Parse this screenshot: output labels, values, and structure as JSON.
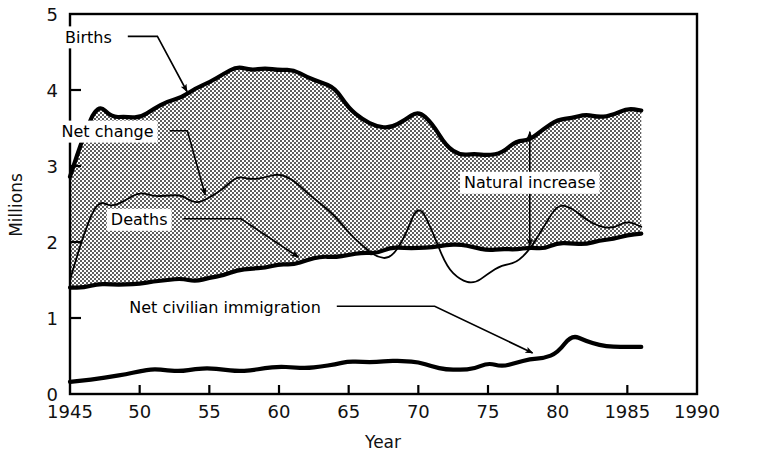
{
  "chart_data": {
    "type": "area",
    "title": "",
    "subtitle": "",
    "xlabel": "Year",
    "ylabel": "Millions",
    "xlim": [
      1945,
      1990
    ],
    "ylim": [
      0,
      5
    ],
    "grid": false,
    "legend_position": "inline-annotations",
    "x_ticks": [
      {
        "value": 1945,
        "label": "1945"
      },
      {
        "value": 1950,
        "label": "50"
      },
      {
        "value": 1955,
        "label": "55"
      },
      {
        "value": 1960,
        "label": "60"
      },
      {
        "value": 1965,
        "label": "65"
      },
      {
        "value": 1970,
        "label": "70"
      },
      {
        "value": 1975,
        "label": "75"
      },
      {
        "value": 1980,
        "label": "80"
      },
      {
        "value": 1985,
        "label": "1985"
      },
      {
        "value": 1990,
        "label": "1990"
      }
    ],
    "y_ticks": [
      {
        "value": 0,
        "label": "0"
      },
      {
        "value": 1,
        "label": "1"
      },
      {
        "value": 2,
        "label": "2"
      },
      {
        "value": 3,
        "label": "3"
      },
      {
        "value": 4,
        "label": "4"
      },
      {
        "value": 5,
        "label": "5"
      }
    ],
    "x": [
      1945,
      1946,
      1947,
      1948,
      1949,
      1950,
      1951,
      1952,
      1953,
      1954,
      1955,
      1956,
      1957,
      1958,
      1959,
      1960,
      1961,
      1962,
      1963,
      1964,
      1965,
      1966,
      1967,
      1968,
      1969,
      1970,
      1971,
      1972,
      1973,
      1974,
      1975,
      1976,
      1977,
      1978,
      1979,
      1980,
      1981,
      1982,
      1983,
      1984,
      1985,
      1986
    ],
    "series": [
      {
        "name": "Births",
        "style": "thick-line-upper-boundary-of-shaded-area",
        "values": [
          2.86,
          3.41,
          3.82,
          3.64,
          3.65,
          3.63,
          3.75,
          3.85,
          3.9,
          4.02,
          4.1,
          4.21,
          4.31,
          4.26,
          4.29,
          4.26,
          4.27,
          4.17,
          4.1,
          4.03,
          3.76,
          3.61,
          3.52,
          3.5,
          3.6,
          3.73,
          3.56,
          3.26,
          3.14,
          3.16,
          3.14,
          3.17,
          3.33,
          3.34,
          3.49,
          3.61,
          3.63,
          3.68,
          3.64,
          3.67,
          3.76,
          3.73
        ]
      },
      {
        "name": "Deaths",
        "style": "thick-line-lower-boundary-of-shaded-area",
        "values": [
          1.4,
          1.4,
          1.45,
          1.44,
          1.44,
          1.45,
          1.48,
          1.5,
          1.52,
          1.48,
          1.53,
          1.56,
          1.63,
          1.65,
          1.66,
          1.71,
          1.7,
          1.76,
          1.81,
          1.8,
          1.83,
          1.86,
          1.85,
          1.93,
          1.92,
          1.92,
          1.93,
          1.96,
          1.97,
          1.93,
          1.89,
          1.91,
          1.9,
          1.93,
          1.91,
          1.99,
          1.98,
          1.97,
          2.02,
          2.04,
          2.09,
          2.11
        ]
      },
      {
        "name": "Net change",
        "style": "thin-line-inside-shaded-area",
        "values": [
          1.5,
          2.12,
          2.55,
          2.46,
          2.55,
          2.66,
          2.6,
          2.61,
          2.62,
          2.5,
          2.58,
          2.7,
          2.87,
          2.82,
          2.85,
          2.9,
          2.82,
          2.65,
          2.5,
          2.35,
          2.12,
          1.95,
          1.8,
          1.78,
          2.05,
          2.52,
          2.15,
          1.68,
          1.5,
          1.45,
          1.58,
          1.7,
          1.72,
          1.9,
          2.2,
          2.5,
          2.45,
          2.3,
          2.2,
          2.18,
          2.28,
          2.2
        ]
      },
      {
        "name": "Net civilian immigration",
        "style": "thick-line-standalone",
        "values": [
          0.16,
          0.18,
          0.2,
          0.23,
          0.26,
          0.3,
          0.33,
          0.31,
          0.3,
          0.33,
          0.34,
          0.32,
          0.3,
          0.31,
          0.34,
          0.36,
          0.35,
          0.34,
          0.36,
          0.39,
          0.43,
          0.42,
          0.42,
          0.44,
          0.43,
          0.42,
          0.36,
          0.32,
          0.32,
          0.33,
          0.41,
          0.36,
          0.41,
          0.46,
          0.47,
          0.54,
          0.78,
          0.7,
          0.64,
          0.62,
          0.62,
          0.62
        ]
      }
    ],
    "annotations": [
      {
        "id": "births",
        "text": "Births",
        "label_x": 1948.0,
        "label_y": 4.62,
        "arrow_to_x": 1953.4,
        "arrow_to_y": 3.98,
        "arrow": "single"
      },
      {
        "id": "net-change",
        "text": "Net change",
        "label_x": 1951.0,
        "label_y": 3.38,
        "arrow_to_x": 1954.7,
        "arrow_to_y": 2.62,
        "arrow": "single"
      },
      {
        "id": "deaths",
        "text": "Deaths",
        "label_x": 1952.0,
        "label_y": 2.22,
        "arrow_to_x": 1961.4,
        "arrow_to_y": 1.8,
        "arrow": "single"
      },
      {
        "id": "natural-increase",
        "text": "Natural increase",
        "label_x": 1978.0,
        "label_y": 2.72,
        "arrow_to_x": 1978.0,
        "arrow_to_y": 3.45,
        "arrow_from_x": 1978.0,
        "arrow_from_y": 1.95,
        "arrow": "double-vertical"
      },
      {
        "id": "net-civilian-immigration",
        "text": "Net civilian immigration",
        "label_x": 1963.0,
        "label_y": 1.07,
        "arrow_to_x": 1978.2,
        "arrow_to_y": 0.54,
        "arrow": "single"
      }
    ]
  }
}
